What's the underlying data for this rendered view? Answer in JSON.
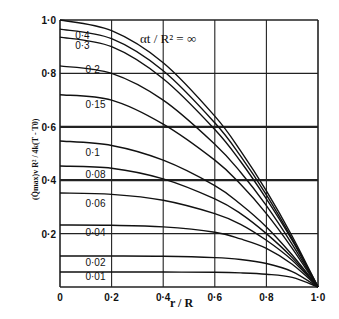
{
  "chart_data": {
    "type": "line",
    "title": "",
    "annotation": "αt / R² = ∞",
    "xlabel": "r / R",
    "ylabel": "(Q̇max)v R² / 4k(T - T0)",
    "xlim": [
      0,
      1.0
    ],
    "ylim": [
      0,
      1.0
    ],
    "grid": true,
    "legend_position": "inline labels",
    "x_ticks": [
      "0",
      "0·2",
      "0·4",
      "0·6",
      "0·8",
      "1·0"
    ],
    "y_ticks": [
      "0·2",
      "0·4",
      "0·6",
      "0·8",
      "1·0"
    ],
    "x": [
      0,
      0.2,
      0.4,
      0.6,
      0.7,
      0.8,
      0.9,
      1.0
    ],
    "series": [
      {
        "name": "∞",
        "values": [
          1.0,
          0.96,
          0.84,
          0.64,
          0.51,
          0.36,
          0.19,
          0
        ]
      },
      {
        "name": "0·4",
        "values": [
          0.966,
          0.93,
          0.81,
          0.615,
          0.49,
          0.345,
          0.18,
          0
        ]
      },
      {
        "name": "0·3",
        "values": [
          0.936,
          0.9,
          0.78,
          0.59,
          0.47,
          0.33,
          0.175,
          0
        ]
      },
      {
        "name": "0·2",
        "values": [
          0.828,
          0.8,
          0.7,
          0.535,
          0.43,
          0.305,
          0.16,
          0
        ]
      },
      {
        "name": "0·15",
        "values": [
          0.72,
          0.7,
          0.61,
          0.475,
          0.385,
          0.275,
          0.145,
          0
        ]
      },
      {
        "name": "0·1",
        "values": [
          0.547,
          0.53,
          0.475,
          0.38,
          0.31,
          0.225,
          0.12,
          0
        ]
      },
      {
        "name": "0·08",
        "values": [
          0.453,
          0.445,
          0.405,
          0.33,
          0.275,
          0.2,
          0.11,
          0
        ]
      },
      {
        "name": "0·06",
        "values": [
          0.352,
          0.347,
          0.325,
          0.275,
          0.235,
          0.175,
          0.1,
          0
        ]
      },
      {
        "name": "0·04",
        "values": [
          0.232,
          0.231,
          0.225,
          0.205,
          0.18,
          0.145,
          0.085,
          0
        ]
      },
      {
        "name": "0·02",
        "values": [
          0.116,
          0.116,
          0.115,
          0.11,
          0.103,
          0.088,
          0.058,
          0
        ]
      },
      {
        "name": "0·01",
        "values": [
          0.056,
          0.056,
          0.056,
          0.055,
          0.053,
          0.048,
          0.036,
          0
        ]
      }
    ],
    "label_positions": [
      {
        "name": "0·4",
        "x": 0.02,
        "y": 0.93
      },
      {
        "name": "0·3",
        "x": 0.02,
        "y": 0.89
      },
      {
        "name": "0·2",
        "x": 0.06,
        "y": 0.8
      },
      {
        "name": "0·15",
        "x": 0.06,
        "y": 0.67
      },
      {
        "name": "0·1",
        "x": 0.06,
        "y": 0.49
      },
      {
        "name": "0·08",
        "x": 0.06,
        "y": 0.41
      },
      {
        "name": "0·06",
        "x": 0.06,
        "y": 0.3
      },
      {
        "name": "0·04",
        "x": 0.06,
        "y": 0.19
      },
      {
        "name": "0·02",
        "x": 0.06,
        "y": 0.08
      },
      {
        "name": "0·01",
        "x": 0.06,
        "y": 0.025
      }
    ]
  },
  "plot": {
    "left": 60,
    "top": 20,
    "right": 318,
    "bottom": 287,
    "line_color": "#111111",
    "grid_color": "#222222"
  }
}
